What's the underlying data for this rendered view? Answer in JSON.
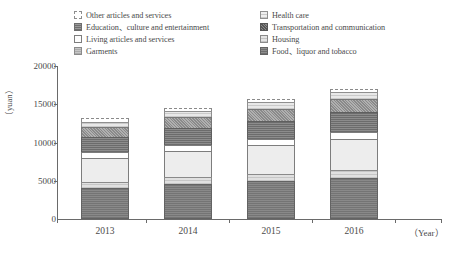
{
  "legend": {
    "left_column": [
      {
        "label": "Other articles and services",
        "key": "other"
      },
      {
        "label": "Education、culture and entertainment",
        "key": "education"
      },
      {
        "label": "Living articles and services",
        "key": "living"
      },
      {
        "label": "Garments",
        "key": "garments"
      }
    ],
    "right_column": [
      {
        "label": "Health care",
        "key": "health"
      },
      {
        "label": "Transportation and communication",
        "key": "transport"
      },
      {
        "label": "Housing",
        "key": "housing"
      },
      {
        "label": "Food、liquor and tobacco",
        "key": "food"
      }
    ]
  },
  "axis": {
    "y_unit": "（yuan）",
    "x_unit": "（Year）",
    "y_ticks": [
      "20000",
      "15000",
      "10000",
      "5000",
      "0"
    ],
    "x_ticks": [
      "2013",
      "2014",
      "2015",
      "2016"
    ]
  },
  "caption": "",
  "chart_data": {
    "type": "bar",
    "title": "",
    "subtitle": "",
    "xlabel": "（Year）",
    "ylabel": "（yuan）",
    "ylim": [
      0,
      20000
    ],
    "ytick_values": [
      0,
      5000,
      10000,
      15000,
      20000
    ],
    "grid": false,
    "stacked": true,
    "legend_position": "top",
    "categories": [
      "2013",
      "2014",
      "2015",
      "2016"
    ],
    "series": [
      {
        "name": "Food、liquor and tobacco",
        "key": "food",
        "values": [
          4100,
          4550,
          4950,
          5400
        ]
      },
      {
        "name": "Housing",
        "key": "housing",
        "values": [
          800,
          880,
          950,
          1030
        ]
      },
      {
        "name": "Living articles and services",
        "key": "living",
        "values": [
          3100,
          3450,
          3750,
          4050
        ]
      },
      {
        "name": "Garments",
        "key": "garments",
        "values": [
          700,
          760,
          820,
          880
        ]
      },
      {
        "name": "Education、culture and entertainment",
        "key": "education",
        "values": [
          2000,
          2200,
          2400,
          2600
        ]
      },
      {
        "name": "Transportation and communication",
        "key": "transport",
        "values": [
          1300,
          1450,
          1550,
          1700
        ]
      },
      {
        "name": "Health care",
        "key": "health",
        "values": [
          700,
          780,
          850,
          920
        ]
      },
      {
        "name": "Other articles and services",
        "key": "other",
        "values": [
          500,
          430,
          430,
          420
        ]
      }
    ],
    "totals": [
      13200,
      14500,
      15700,
      17000
    ]
  },
  "colors": {
    "axis": "#6a6a6a",
    "text": "#4a4a4a",
    "food": "#7e7e7e",
    "housing": "#d4d4d4",
    "living": "#ededed",
    "garments": "#ffffff",
    "education": "#7c7c7c",
    "transport": "#9d9d9d",
    "health": "#dcdcdc",
    "other": "#ffffff"
  }
}
